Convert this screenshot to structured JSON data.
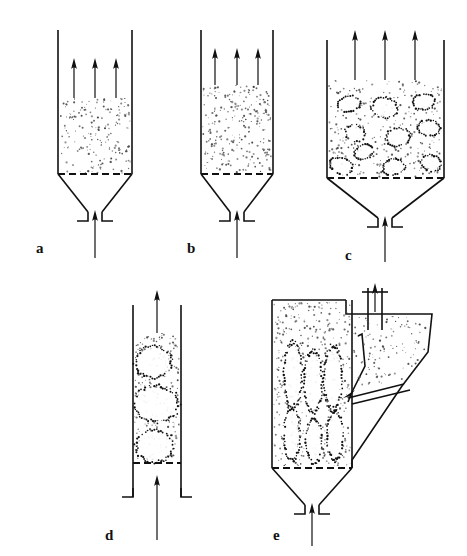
{
  "figure": {
    "background_color": "#ffffff",
    "ink_color": "#111111",
    "particle_color": "#4a4a4a",
    "width": 467,
    "height": 556
  },
  "panels": [
    {
      "id": "a",
      "label": "a",
      "label_x": 36,
      "label_y": 241,
      "regime": "fixed-bed-incipient-fluidization",
      "vessel": "cylindrical-column-with-conical-bottom",
      "column_left": 58,
      "column_right": 132,
      "column_top": 30,
      "distributor_y": 174,
      "bed_top_y": 98,
      "cone_bottom_y": 212,
      "inlet_x": 95,
      "inlet_arrow_bottom_y": 258,
      "top_arrow_count": 3,
      "top_arrow_xs": [
        74,
        95,
        116
      ],
      "top_arrow_top_y": 58,
      "top_arrow_bottom_y": 98,
      "bubbles": [],
      "particle_density": 180,
      "has_cone": true,
      "has_cyclone": false
    },
    {
      "id": "b",
      "label": "b",
      "label_x": 187,
      "label_y": 241,
      "regime": "bubbling-onset-expanded-bed",
      "vessel": "cylindrical-column-with-conical-bottom",
      "column_left": 201,
      "column_right": 273,
      "column_top": 30,
      "distributor_y": 174,
      "bed_top_y": 85,
      "cone_bottom_y": 212,
      "inlet_x": 237,
      "inlet_arrow_bottom_y": 258,
      "top_arrow_count": 3,
      "top_arrow_xs": [
        215,
        237,
        258
      ],
      "top_arrow_top_y": 48,
      "top_arrow_bottom_y": 85,
      "bubbles": [],
      "particle_density": 260,
      "has_cone": true,
      "has_cyclone": false
    },
    {
      "id": "c",
      "label": "c",
      "label_x": 345,
      "label_y": 248,
      "regime": "bubbling-fluidized-bed",
      "vessel": "cylindrical-column-with-conical-bottom",
      "column_left": 327,
      "column_right": 444,
      "column_top": 40,
      "distributor_y": 178,
      "bed_top_y": 80,
      "cone_bottom_y": 218,
      "inlet_x": 385,
      "inlet_arrow_bottom_y": 262,
      "top_arrow_count": 3,
      "top_arrow_xs": [
        355,
        385,
        415
      ],
      "top_arrow_top_y": 30,
      "top_arrow_bottom_y": 80,
      "bubbles": [
        {
          "cx": 349,
          "cy": 104,
          "rx": 11,
          "ry": 8,
          "rot": -12
        },
        {
          "cx": 385,
          "cy": 108,
          "rx": 13,
          "ry": 10,
          "rot": 8
        },
        {
          "cx": 424,
          "cy": 102,
          "rx": 11,
          "ry": 8,
          "rot": -5
        },
        {
          "cx": 355,
          "cy": 133,
          "rx": 10,
          "ry": 8,
          "rot": 15
        },
        {
          "cx": 398,
          "cy": 137,
          "rx": 12,
          "ry": 9,
          "rot": -8
        },
        {
          "cx": 429,
          "cy": 128,
          "rx": 11,
          "ry": 8,
          "rot": 10
        },
        {
          "cx": 364,
          "cy": 152,
          "rx": 10,
          "ry": 7,
          "rot": -20
        },
        {
          "cx": 341,
          "cy": 166,
          "rx": 12,
          "ry": 8,
          "rot": 18
        },
        {
          "cx": 394,
          "cy": 167,
          "rx": 11,
          "ry": 8,
          "rot": -6
        },
        {
          "cx": 431,
          "cy": 163,
          "rx": 10,
          "ry": 8,
          "rot": 12
        }
      ],
      "particle_density": 300,
      "has_cone": true,
      "has_cyclone": false
    },
    {
      "id": "d",
      "label": "d",
      "label_x": 105,
      "label_y": 528,
      "regime": "slugging-bed",
      "vessel": "narrow-cylindrical-column",
      "column_left": 133,
      "column_right": 181,
      "column_top": 305,
      "distributor_y": 463,
      "bed_top_y": 333,
      "cone_bottom_y": 497,
      "inlet_x": 157,
      "inlet_arrow_bottom_y": 540,
      "top_arrow_count": 1,
      "top_arrow_xs": [
        157
      ],
      "top_arrow_top_y": 290,
      "top_arrow_bottom_y": 333,
      "bubbles": [
        {
          "cx": 153,
          "cy": 362,
          "rx": 18,
          "ry": 16,
          "rot": -8
        },
        {
          "cx": 157,
          "cy": 404,
          "rx": 22,
          "ry": 18,
          "rot": 6
        },
        {
          "cx": 155,
          "cy": 446,
          "rx": 19,
          "ry": 16,
          "rot": -4
        }
      ],
      "particle_density": 230,
      "has_cone": false,
      "has_cyclone": false
    },
    {
      "id": "e",
      "label": "e",
      "label_x": 273,
      "label_y": 528,
      "regime": "circulating-fluidized-bed-with-solids-return",
      "vessel": "column-with-cyclone-and-return-leg",
      "column_left": 272,
      "column_right": 352,
      "column_top": 300,
      "distributor_y": 468,
      "bed_top_y": 300,
      "cone_bottom_y": 505,
      "inlet_x": 312,
      "inlet_arrow_bottom_y": 546,
      "top_arrow_count": 1,
      "top_arrow_xs": [
        375
      ],
      "top_arrow_top_y": 283,
      "top_arrow_bottom_y": 312,
      "bubbles": [
        {
          "cx": 293,
          "cy": 375,
          "rx": 9,
          "ry": 32,
          "rot": 0
        },
        {
          "cx": 313,
          "cy": 382,
          "rx": 9,
          "ry": 30,
          "rot": 0
        },
        {
          "cx": 333,
          "cy": 378,
          "rx": 9,
          "ry": 32,
          "rot": 0
        },
        {
          "cx": 292,
          "cy": 434,
          "rx": 8,
          "ry": 26,
          "rot": 0
        },
        {
          "cx": 314,
          "cy": 441,
          "rx": 8,
          "ry": 22,
          "rot": 0
        },
        {
          "cx": 335,
          "cy": 436,
          "rx": 8,
          "ry": 24,
          "rot": 0
        }
      ],
      "particle_density": 420,
      "has_cone": true,
      "has_cyclone": true,
      "exit_pipe_x": 375,
      "return_leg_arrow": "down-right"
    }
  ]
}
